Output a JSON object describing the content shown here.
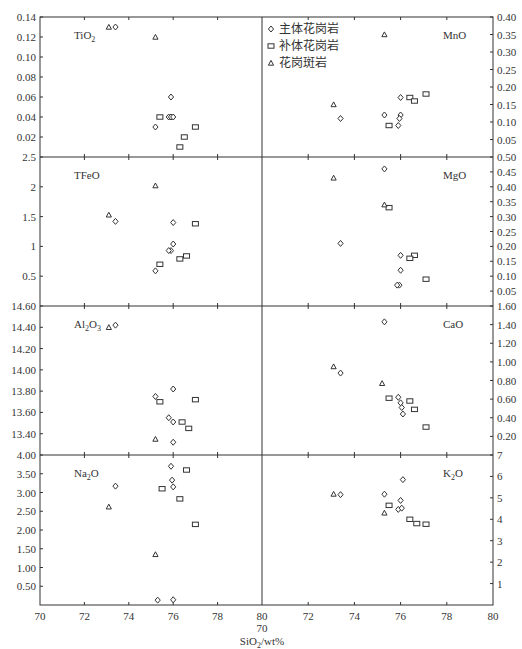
{
  "chart_data": {
    "type": "scatter",
    "title": "",
    "xlabel": "SiO2/wt%",
    "xlabel_parts": {
      "base": "SiO",
      "sub": "2",
      "suffix": "/wt%"
    },
    "x_range": [
      70,
      80
    ],
    "x_ticks": [
      70,
      72,
      74,
      76,
      78,
      80
    ],
    "x_ticks_right": [
      72,
      74,
      76,
      78,
      80
    ],
    "x_mid_extra_label": "70",
    "legend": {
      "position": "top-right-panel upper-left",
      "entries": [
        {
          "symbol": "diamond",
          "label": "主体花岗岩"
        },
        {
          "symbol": "square",
          "label": "补体花岗岩"
        },
        {
          "symbol": "triangle",
          "label": "花岗斑岩"
        }
      ]
    },
    "grid": false,
    "panels": [
      {
        "id": "TiO2",
        "label": "TiO",
        "label_sub": "2",
        "label_after": "",
        "column": "left",
        "row": 0,
        "ylim": [
          0,
          0.14
        ],
        "y_ticks": [
          0.02,
          0.04,
          0.06,
          0.08,
          0.1,
          0.12,
          0.14
        ],
        "y_tick_labels": [
          "0.02",
          "0.04",
          "0.06",
          "0.08",
          "0.10",
          "0.12",
          "0.14"
        ],
        "series": [
          {
            "name": "主体花岗岩",
            "symbol": "diamond",
            "points": [
              [
                73.4,
                0.13
              ],
              [
                75.9,
                0.06
              ],
              [
                75.2,
                0.03
              ],
              [
                75.8,
                0.04
              ],
              [
                75.9,
                0.04
              ],
              [
                76.0,
                0.04
              ]
            ]
          },
          {
            "name": "补体花岗岩",
            "symbol": "square",
            "points": [
              [
                75.4,
                0.04
              ],
              [
                77.0,
                0.03
              ],
              [
                76.5,
                0.02
              ],
              [
                76.3,
                0.01
              ]
            ]
          },
          {
            "name": "花岗斑岩",
            "symbol": "triangle",
            "points": [
              [
                73.1,
                0.13
              ],
              [
                75.2,
                0.12
              ]
            ]
          }
        ]
      },
      {
        "id": "MnO",
        "label": "MnO",
        "label_sub": "",
        "label_after": "",
        "column": "right",
        "row": 0,
        "ylim": [
          0,
          0.4
        ],
        "y_ticks": [
          0.05,
          0.1,
          0.15,
          0.2,
          0.25,
          0.3,
          0.35,
          0.4
        ],
        "y_tick_labels": [
          "0.05",
          "0.10",
          "0.15",
          "0.20",
          "0.25",
          "0.30",
          "0.35",
          "0.40"
        ],
        "series": [
          {
            "name": "主体花岗岩",
            "symbol": "diamond",
            "points": [
              [
                73.4,
                0.11
              ],
              [
                75.3,
                0.12
              ],
              [
                76.0,
                0.17
              ],
              [
                76.0,
                0.12
              ],
              [
                75.95,
                0.11
              ],
              [
                75.9,
                0.09
              ]
            ]
          },
          {
            "name": "补体花岗岩",
            "symbol": "square",
            "points": [
              [
                75.5,
                0.09
              ],
              [
                76.4,
                0.17
              ],
              [
                76.6,
                0.16
              ],
              [
                77.1,
                0.18
              ]
            ]
          },
          {
            "name": "花岗斑岩",
            "symbol": "triangle",
            "points": [
              [
                73.1,
                0.15
              ],
              [
                75.3,
                0.35
              ]
            ]
          }
        ]
      },
      {
        "id": "TFeO",
        "label": "TFeO",
        "label_sub": "",
        "label_after": "",
        "column": "left",
        "row": 1,
        "ylim": [
          0,
          2.5
        ],
        "y_ticks": [
          0.5,
          1,
          1.5,
          2,
          2.5
        ],
        "y_tick_labels": [
          "0.5",
          "1",
          "1.5",
          "2",
          "2.5"
        ],
        "series": [
          {
            "name": "主体花岗岩",
            "symbol": "diamond",
            "points": [
              [
                73.4,
                1.42
              ],
              [
                76.0,
                1.4
              ],
              [
                76.0,
                1.04
              ],
              [
                75.9,
                0.93
              ],
              [
                75.8,
                0.93
              ],
              [
                75.2,
                0.59
              ]
            ]
          },
          {
            "name": "补体花岗岩",
            "symbol": "square",
            "points": [
              [
                77.0,
                1.38
              ],
              [
                76.6,
                0.84
              ],
              [
                76.3,
                0.79
              ],
              [
                75.4,
                0.7
              ]
            ]
          },
          {
            "name": "花岗斑岩",
            "symbol": "triangle",
            "points": [
              [
                73.1,
                1.53
              ],
              [
                75.2,
                2.02
              ]
            ]
          }
        ]
      },
      {
        "id": "MgO",
        "label": "MgO",
        "label_sub": "",
        "label_after": "",
        "column": "right",
        "row": 1,
        "ylim": [
          0,
          0.5
        ],
        "y_ticks": [
          0.05,
          0.1,
          0.15,
          0.2,
          0.25,
          0.3,
          0.35,
          0.4,
          0.45,
          0.5
        ],
        "y_tick_labels": [
          "0.05",
          "0.10",
          "0.15",
          "0.20",
          "0.25",
          "0.30",
          "0.35",
          "0.40",
          "0.45",
          "0.50"
        ],
        "series": [
          {
            "name": "主体花岗岩",
            "symbol": "diamond",
            "points": [
              [
                75.3,
                0.46
              ],
              [
                73.4,
                0.21
              ],
              [
                76.0,
                0.17
              ],
              [
                76.0,
                0.12
              ],
              [
                75.95,
                0.07
              ],
              [
                75.85,
                0.07
              ]
            ]
          },
          {
            "name": "补体花岗岩",
            "symbol": "square",
            "points": [
              [
                75.5,
                0.33
              ],
              [
                76.6,
                0.17
              ],
              [
                76.4,
                0.16
              ],
              [
                77.1,
                0.09
              ]
            ]
          },
          {
            "name": "花岗斑岩",
            "symbol": "triangle",
            "points": [
              [
                73.1,
                0.43
              ],
              [
                75.3,
                0.34
              ]
            ]
          }
        ]
      },
      {
        "id": "Al2O3",
        "label": "Al",
        "label_sub": "2",
        "label_after": "O",
        "label_sub2": "3",
        "column": "left",
        "row": 2,
        "ylim": [
          13.2,
          14.6
        ],
        "y_ticks": [
          13.4,
          13.6,
          13.8,
          14.0,
          14.2,
          14.4,
          14.6
        ],
        "y_tick_labels": [
          "13.40",
          "13.60",
          "13.80",
          "14.00",
          "14.20",
          "14.40",
          "14.60"
        ],
        "series": [
          {
            "name": "主体花岗岩",
            "symbol": "diamond",
            "points": [
              [
                73.4,
                14.42
              ],
              [
                76.0,
                13.82
              ],
              [
                75.2,
                13.75
              ],
              [
                75.8,
                13.55
              ],
              [
                76.0,
                13.51
              ],
              [
                76.0,
                13.32
              ]
            ]
          },
          {
            "name": "补体花岗岩",
            "symbol": "square",
            "points": [
              [
                75.4,
                13.7
              ],
              [
                77.0,
                13.72
              ],
              [
                76.4,
                13.51
              ],
              [
                76.7,
                13.45
              ]
            ]
          },
          {
            "name": "花岗斑岩",
            "symbol": "triangle",
            "points": [
              [
                73.1,
                14.4
              ],
              [
                75.2,
                13.35
              ]
            ]
          }
        ]
      },
      {
        "id": "CaO",
        "label": "CaO",
        "label_sub": "",
        "label_after": "",
        "column": "right",
        "row": 2,
        "ylim": [
          0,
          1.6
        ],
        "y_ticks": [
          0.2,
          0.4,
          0.6,
          0.8,
          1.0,
          1.2,
          1.4,
          1.6
        ],
        "y_tick_labels": [
          "0.20",
          "0.40",
          "0.60",
          "0.80",
          "1.00",
          "1.20",
          "1.40",
          "1.60"
        ],
        "series": [
          {
            "name": "主体花岗岩",
            "symbol": "diamond",
            "points": [
              [
                75.3,
                1.43
              ],
              [
                73.4,
                0.88
              ],
              [
                75.9,
                0.62
              ],
              [
                76.0,
                0.56
              ],
              [
                76.05,
                0.51
              ],
              [
                76.1,
                0.44
              ]
            ]
          },
          {
            "name": "补体花岗岩",
            "symbol": "square",
            "points": [
              [
                75.5,
                0.61
              ],
              [
                76.4,
                0.58
              ],
              [
                76.6,
                0.49
              ],
              [
                77.1,
                0.3
              ]
            ]
          },
          {
            "name": "花岗斑岩",
            "symbol": "triangle",
            "points": [
              [
                73.1,
                0.95
              ],
              [
                75.2,
                0.77
              ]
            ]
          }
        ]
      },
      {
        "id": "Na2O",
        "label": "Na",
        "label_sub": "2",
        "label_after": "O",
        "column": "left",
        "row": 3,
        "ylim": [
          0,
          4.0
        ],
        "y_ticks": [
          0.5,
          1.0,
          1.5,
          2.0,
          2.5,
          3.0,
          3.5,
          4.0
        ],
        "y_tick_labels": [
          "0.50",
          "1.00",
          "1.50",
          "2.00",
          "2.50",
          "3.00",
          "3.50",
          "4.00"
        ],
        "series": [
          {
            "name": "主体花岗岩",
            "symbol": "diamond",
            "points": [
              [
                75.9,
                3.7
              ],
              [
                75.95,
                3.33
              ],
              [
                76.0,
                3.15
              ],
              [
                73.4,
                3.17
              ],
              [
                75.3,
                0.13
              ],
              [
                76.0,
                0.14
              ]
            ]
          },
          {
            "name": "补体花岗岩",
            "symbol": "square",
            "points": [
              [
                76.6,
                3.6
              ],
              [
                75.5,
                3.1
              ],
              [
                76.3,
                2.83
              ],
              [
                77.0,
                2.15
              ]
            ]
          },
          {
            "name": "花岗斑岩",
            "symbol": "triangle",
            "points": [
              [
                73.1,
                2.62
              ],
              [
                75.2,
                1.35
              ]
            ]
          }
        ]
      },
      {
        "id": "K2O",
        "label": "K",
        "label_sub": "2",
        "label_after": "O",
        "column": "right",
        "row": 3,
        "ylim": [
          0,
          7
        ],
        "y_ticks": [
          1,
          2,
          3,
          4,
          5,
          6,
          7
        ],
        "y_tick_labels": [
          "1",
          "2",
          "3",
          "4",
          "5",
          "6",
          "7"
        ],
        "series": [
          {
            "name": "主体花岗岩",
            "symbol": "diamond",
            "points": [
              [
                76.1,
                5.85
              ],
              [
                73.4,
                5.15
              ],
              [
                75.3,
                5.17
              ],
              [
                76.0,
                4.88
              ],
              [
                75.9,
                4.46
              ],
              [
                76.05,
                4.52
              ]
            ]
          },
          {
            "name": "补体花岗岩",
            "symbol": "square",
            "points": [
              [
                75.5,
                4.65
              ],
              [
                76.4,
                4.0
              ],
              [
                76.7,
                3.8
              ],
              [
                77.1,
                3.77
              ]
            ]
          },
          {
            "name": "花岗斑岩",
            "symbol": "triangle",
            "points": [
              [
                73.1,
                5.18
              ],
              [
                75.3,
                4.3
              ]
            ]
          }
        ]
      }
    ]
  }
}
